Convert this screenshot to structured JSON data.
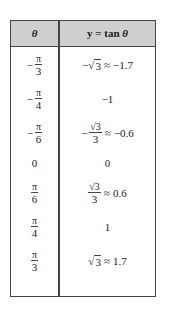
{
  "table": {
    "headers": {
      "theta": "θ",
      "y_label": "y = tan ",
      "y_theta": "θ"
    },
    "rows": [
      {
        "theta": {
          "sign": "−",
          "num": "π",
          "den": "3"
        },
        "value": {
          "sign": "−",
          "sqrt_sym": "√",
          "radicand": "3",
          "approx": "≈",
          "decimal": "−1.7"
        }
      },
      {
        "theta": {
          "sign": "−",
          "num": "π",
          "den": "4"
        },
        "value": {
          "text": "−1"
        }
      },
      {
        "theta": {
          "sign": "−",
          "num": "π",
          "den": "6"
        },
        "value": {
          "sign": "−",
          "sqrt_sym": "√",
          "radicand": "3",
          "den": "3",
          "approx": "≈",
          "decimal": "−0.6"
        }
      },
      {
        "theta": {
          "text": "0"
        },
        "value": {
          "text": "0"
        }
      },
      {
        "theta": {
          "num": "π",
          "den": "6"
        },
        "value": {
          "sqrt_sym": "√",
          "radicand": "3",
          "den": "3",
          "approx": "≈",
          "decimal": "0.6"
        }
      },
      {
        "theta": {
          "num": "π",
          "den": "4"
        },
        "value": {
          "text": "1"
        }
      },
      {
        "theta": {
          "num": "π",
          "den": "3"
        },
        "value": {
          "sqrt_sym": "√",
          "radicand": "3",
          "approx": "≈",
          "decimal": "1.7"
        }
      }
    ]
  },
  "colors": {
    "header_bg": "#cfcfcf",
    "border": "#444444",
    "text": "#222222"
  }
}
